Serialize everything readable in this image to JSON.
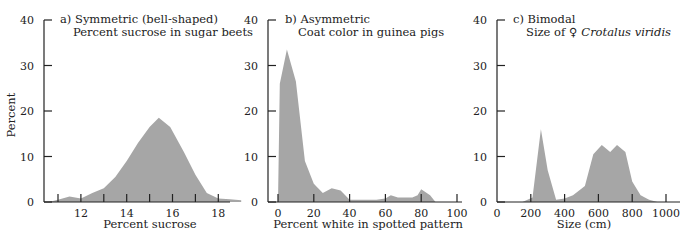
{
  "figure": {
    "ylabel": "Percent",
    "fill_color": "#a6a6a6",
    "axis_color": "#222222"
  },
  "chart_data": [
    {
      "type": "area",
      "panel": "a",
      "title": "a) Symmetric (bell-shaped)",
      "subtitle": "Percent sucrose in sugar beets",
      "xlabel": "Percent sucrose",
      "ylabel": "Percent",
      "ylim": [
        0,
        40
      ],
      "yticks": [
        0,
        10,
        20,
        30,
        40
      ],
      "xlim": [
        10.4,
        19
      ],
      "xticks": [
        11,
        12,
        13,
        14,
        15,
        16,
        17,
        18
      ],
      "xtick_labels": [
        "12",
        "14",
        "16",
        "18"
      ],
      "x": [
        10.6,
        11.0,
        11.5,
        12.0,
        12.5,
        13.0,
        13.5,
        14.0,
        14.5,
        15.0,
        15.4,
        15.9,
        16.5,
        17.0,
        17.5,
        18.0,
        18.5,
        19.0
      ],
      "values": [
        0,
        0.5,
        1.2,
        0.8,
        2.0,
        3.0,
        5.5,
        9.0,
        13.0,
        16.5,
        18.5,
        16.5,
        11.0,
        6.0,
        2.0,
        0.8,
        0.6,
        0.4
      ],
      "grid": false,
      "legend": null
    },
    {
      "type": "area",
      "panel": "b",
      "title": "b) Asymmetric",
      "subtitle": "Coat color in guinea pigs",
      "xlabel": "Percent white in spotted pattern",
      "ylabel": "",
      "ylim": [
        0,
        40
      ],
      "yticks": [
        0,
        10,
        20,
        30,
        40
      ],
      "xlim": [
        -5,
        100
      ],
      "xticks": [
        0,
        20,
        40,
        60,
        80,
        100
      ],
      "xtick_labels": [
        "0",
        "20",
        "40",
        "60",
        "80",
        "100"
      ],
      "x": [
        0,
        1,
        5,
        10,
        15,
        20,
        25,
        30,
        35,
        40,
        45,
        55,
        60,
        63,
        67,
        75,
        78,
        80,
        85,
        88
      ],
      "values": [
        0,
        26,
        33.5,
        26.5,
        9,
        4,
        2,
        3,
        2.5,
        0.5,
        0.5,
        0.5,
        0.8,
        1.5,
        1.0,
        1.0,
        1.5,
        2.8,
        1.5,
        0
      ],
      "grid": false,
      "legend": null
    },
    {
      "type": "area",
      "panel": "c",
      "title": "c) Bimodal",
      "subtitle": "Size of ♀ Crotalus viridis",
      "subtitle_plain": "Size of ♀",
      "subtitle_italic": "Crotalus viridis",
      "xlabel": "Size (cm)",
      "ylabel": "",
      "ylim": [
        0,
        40
      ],
      "yticks": [
        0,
        10,
        20,
        30,
        40
      ],
      "xlim": [
        0,
        1050
      ],
      "xticks": [
        0,
        200,
        400,
        600,
        800,
        1000
      ],
      "xtick_labels": [
        "0",
        "200",
        "400",
        "600",
        "800",
        "1000"
      ],
      "x": [
        150,
        210,
        260,
        300,
        350,
        400,
        450,
        520,
        570,
        620,
        670,
        710,
        760,
        800,
        850,
        900,
        950
      ],
      "values": [
        0,
        1,
        16,
        7,
        0.5,
        0.8,
        1.5,
        3.5,
        10.5,
        12.5,
        11,
        12.5,
        11,
        4.5,
        1.5,
        0.5,
        0
      ],
      "grid": false,
      "legend": null
    }
  ]
}
